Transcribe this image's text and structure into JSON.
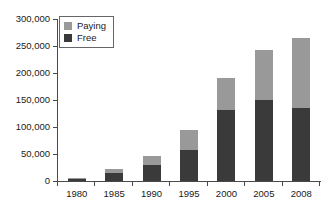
{
  "chart_data": {
    "type": "bar",
    "title": "",
    "subtitle": "",
    "xlabel": "",
    "ylabel": "",
    "stacked": true,
    "grid": false,
    "legend_position": "top-left",
    "categories": [
      "1980",
      "1985",
      "1990",
      "1995",
      "2000",
      "2005",
      "2008"
    ],
    "ylim": [
      0,
      300000
    ],
    "ytick_values": [
      0,
      50000,
      100000,
      150000,
      200000,
      250000,
      300000
    ],
    "ytick_labels": [
      "0",
      "50,000",
      "100,000",
      "150,000",
      "200,000",
      "250,000",
      "300,000"
    ],
    "series": [
      {
        "name": "Free",
        "color": "#3a3a3a",
        "values": [
          4000,
          15000,
          30000,
          57000,
          131000,
          150000,
          135000
        ]
      },
      {
        "name": "Paying",
        "color": "#999999",
        "values": [
          1000,
          7000,
          17000,
          37000,
          59000,
          92000,
          130000
        ]
      }
    ],
    "totals": [
      5000,
      22000,
      47000,
      94000,
      190000,
      242000,
      265000
    ]
  },
  "legend": {
    "entries": [
      {
        "label": "Paying",
        "swatch": "#999999"
      },
      {
        "label": "Free",
        "swatch": "#3a3a3a"
      }
    ]
  },
  "axis_colors": {
    "line": "#4a4a4a",
    "text": "#1a1a1a"
  }
}
